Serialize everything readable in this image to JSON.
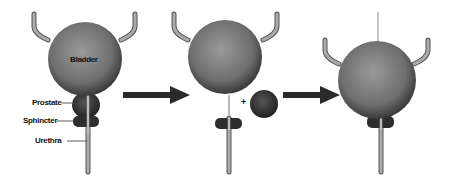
{
  "diagram": {
    "panels": [
      {
        "id": "normal",
        "description": "Bladder with prostate, sphincter and urethra"
      },
      {
        "id": "removal",
        "description": "Prostate removed, separated from bladder and sphincter"
      },
      {
        "id": "reconnected",
        "description": "Bladder reconnected directly to sphincter and urethra"
      }
    ],
    "labels": {
      "bladder": "Bladder",
      "prostate": "Prostate",
      "sphincter": "Sphincter",
      "urethra": "Urethra"
    },
    "plus_sign": "+",
    "colors": {
      "bladder": "#7a7a7a",
      "bladder_dark": "#3a3a3a",
      "prostate": "#3c3c3c",
      "sphincter": "#2e2e2e",
      "tube": "#a8a8a8",
      "tube_outline": "#555555",
      "arrow": "#2a2a2a",
      "background": "#ffffff"
    }
  }
}
